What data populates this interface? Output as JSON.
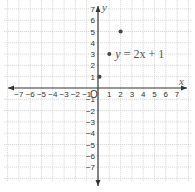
{
  "chart_data": {
    "type": "scatter",
    "title": "",
    "xlabel": "x",
    "ylabel": "y",
    "origin_label": "O",
    "xlim": [
      -7,
      7
    ],
    "ylim": [
      -7,
      7
    ],
    "grid": true,
    "grid_style": "dotted",
    "x_ticks": [
      -7,
      -6,
      -5,
      -4,
      -3,
      -2,
      -1,
      1,
      2,
      3,
      4,
      5,
      6,
      7
    ],
    "x_tick_labels": [
      "−7",
      "−6",
      "−5",
      "−4",
      "−3",
      "−2",
      "−1",
      "1",
      "2",
      "3",
      "4",
      "5",
      "6",
      "7"
    ],
    "y_ticks": [
      7,
      6,
      5,
      4,
      3,
      2,
      1,
      -1,
      -2,
      -3,
      -4,
      -5,
      -6,
      -7
    ],
    "y_tick_labels": [
      "7",
      "6",
      "5",
      "4",
      "3",
      "2",
      "1",
      "−1",
      "−2",
      "−3",
      "−4",
      "−5",
      "−6",
      "−7"
    ],
    "series": [
      {
        "name": "y = 2x + 1",
        "points": [
          {
            "x": 0,
            "y": 1
          },
          {
            "x": 1,
            "y": 3
          },
          {
            "x": 2,
            "y": 5
          }
        ]
      }
    ],
    "annotations": [
      {
        "text": "y = 2x + 1",
        "near_point": {
          "x": 1,
          "y": 3
        }
      }
    ]
  },
  "equation": {
    "var_y": "y",
    "equals": " = ",
    "expr": "2x + 1"
  },
  "colors": {
    "axis": "#333333",
    "grid": "#c8c8c8",
    "point": "#444444",
    "text": "#333333"
  }
}
